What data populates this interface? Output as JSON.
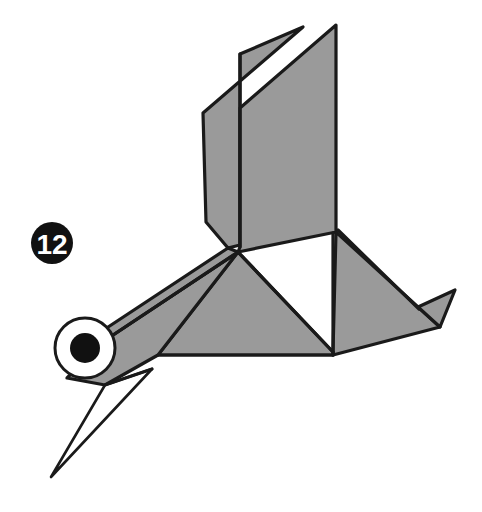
{
  "figure": {
    "canvas": {
      "width": 482,
      "height": 512,
      "background": "#ffffff"
    }
  },
  "step_badge": {
    "label": "12",
    "shape": "filled-circle",
    "fill": "#111111",
    "text_color": "#ffffff",
    "cx": 52,
    "cy": 243,
    "r": 21
  },
  "palette": {
    "paper_front": "#9a9a9a",
    "paper_back": "#ffffff",
    "outline": "#1a1a1a",
    "eye_white": "#ffffff",
    "eye_pupil": "#111111",
    "badge_fill": "#111111",
    "badge_text": "#ffffff"
  },
  "eye": {
    "cx": 85,
    "cy": 348,
    "outer_r": 30,
    "pupil_r": 15,
    "outline_width": 3
  },
  "shapes": {
    "wing_left_panel": {
      "name": "wing-left-panel",
      "fill": "#9a9a9a",
      "points": "303,27 203,113 206,222 228,248 240,245 240,54"
    },
    "wing_right_panel": {
      "name": "wing-right-panel",
      "fill": "#9a9a9a",
      "points": "336,25 240,108 240,247 238,252 336,232"
    },
    "body_main": {
      "name": "body-main",
      "fill": "#9a9a9a",
      "points": "238,252 333,352 333,355 158,355"
    },
    "body_right": {
      "name": "body-right-panel",
      "fill": "#9a9a9a",
      "points": "336,232 418,307 440,327 333,355 333,352"
    },
    "tail_flap": {
      "name": "tail-flap",
      "fill": "#9a9a9a",
      "points": "418,307 455,290 440,327"
    },
    "neck_upper": {
      "name": "neck-upper-band",
      "fill": "#9a9a9a",
      "points": "238,252 228,248 96,335 104,341"
    },
    "neck_lower": {
      "name": "neck-lower-panel",
      "fill": "#9a9a9a",
      "points": "238,252 158,355 105,385 67,378 104,341"
    },
    "beak": {
      "name": "beak-white-triangle",
      "fill": "#ffffff",
      "points": "105,385 152,369 51,477"
    }
  },
  "fold_lines": [
    {
      "name": "wing-left-crease",
      "from": [
        240,
        54
      ],
      "to": [
        240,
        247
      ]
    },
    {
      "name": "body-center-crease",
      "from": [
        333,
        232
      ],
      "to": [
        333,
        355
      ]
    },
    {
      "name": "neck-inner-crease",
      "from": [
        238,
        252
      ],
      "to": [
        104,
        341
      ]
    },
    {
      "name": "body-diagonal-crease",
      "from": [
        238,
        252
      ],
      "to": [
        333,
        352
      ]
    },
    {
      "name": "tail-inner-crease",
      "from": [
        336,
        228
      ],
      "to": [
        418,
        307
      ]
    },
    {
      "name": "beak-fold-crease",
      "from": [
        105,
        385
      ],
      "to": [
        152,
        369
      ]
    }
  ],
  "labels": {
    "figure_caption": "",
    "step_number": "12"
  }
}
